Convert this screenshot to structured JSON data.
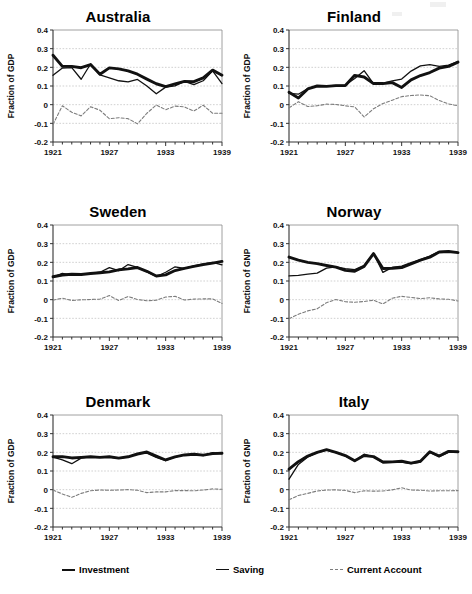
{
  "figure": {
    "panel_order": [
      "australia",
      "finland",
      "sweden",
      "norway",
      "denmark",
      "italy"
    ],
    "x_tick_labels": [
      "1921",
      "1927",
      "1933",
      "1939"
    ],
    "y_tick_labels": [
      "0.4",
      "0.3",
      "0.2",
      "0.1",
      "0",
      "-0.1",
      "-0.2"
    ],
    "colors": {
      "investment": "#111111",
      "saving": "#111111",
      "current_account": "#7d7d7d",
      "frame": "#888888",
      "gridline": "#bdbdbd",
      "background": "#ffffff"
    }
  },
  "legend": {
    "items": [
      {
        "key": "investment",
        "label": "Investment",
        "style": "thick"
      },
      {
        "key": "saving",
        "label": "Saving",
        "style": "thin"
      },
      {
        "key": "current_account",
        "label": "Current Account",
        "style": "dash"
      }
    ]
  },
  "chart_data": [
    {
      "type": "line",
      "title": "Australia",
      "xlabel": "",
      "ylabel": "Fraction of GDP",
      "xlim": [
        1921,
        1939
      ],
      "ylim": [
        -0.2,
        0.4
      ],
      "yticks": [
        0.4,
        0.3,
        0.2,
        0.1,
        0,
        -0.1,
        -0.2
      ],
      "xticks": [
        1921,
        1927,
        1933,
        1939
      ],
      "grid": true,
      "legend_position": "below-figure",
      "x": [
        1921,
        1922,
        1923,
        1924,
        1925,
        1926,
        1927,
        1928,
        1929,
        1930,
        1931,
        1932,
        1933,
        1934,
        1935,
        1936,
        1937,
        1938,
        1939
      ],
      "series": [
        {
          "name": "Investment",
          "values": [
            0.265,
            0.205,
            0.205,
            0.198,
            0.215,
            0.163,
            0.197,
            0.192,
            0.181,
            0.163,
            0.137,
            0.112,
            0.097,
            0.111,
            0.125,
            0.123,
            0.143,
            0.185,
            0.158
          ]
        },
        {
          "name": "Saving",
          "values": [
            0.157,
            0.196,
            0.198,
            0.136,
            0.218,
            0.159,
            0.143,
            0.128,
            0.122,
            0.135,
            0.1,
            0.058,
            0.094,
            0.101,
            0.125,
            0.107,
            0.128,
            0.181,
            0.113
          ]
        },
        {
          "name": "Current Account",
          "values": [
            -0.106,
            -0.006,
            -0.041,
            -0.06,
            -0.011,
            -0.03,
            -0.075,
            -0.07,
            -0.075,
            -0.103,
            -0.046,
            -0.002,
            -0.027,
            -0.008,
            -0.012,
            -0.034,
            -0.003,
            -0.046,
            -0.046
          ]
        }
      ]
    },
    {
      "type": "line",
      "title": "Finland",
      "xlabel": "",
      "ylabel": "Fraction of GDP",
      "xlim": [
        1921,
        1939
      ],
      "ylim": [
        -0.2,
        0.4
      ],
      "yticks": [
        0.4,
        0.3,
        0.2,
        0.1,
        0,
        -0.1,
        -0.2
      ],
      "xticks": [
        1921,
        1927,
        1933,
        1939
      ],
      "grid": true,
      "legend_position": "below-figure",
      "x": [
        1921,
        1922,
        1923,
        1924,
        1925,
        1926,
        1927,
        1928,
        1929,
        1930,
        1931,
        1932,
        1933,
        1934,
        1935,
        1936,
        1937,
        1938,
        1939
      ],
      "series": [
        {
          "name": "Investment",
          "values": [
            0.066,
            0.036,
            0.084,
            0.1,
            0.098,
            0.102,
            0.103,
            0.157,
            0.148,
            0.113,
            0.113,
            0.118,
            0.092,
            0.133,
            0.156,
            0.172,
            0.196,
            0.205,
            0.228
          ]
        },
        {
          "name": "Saving",
          "values": [
            0.06,
            0.056,
            0.086,
            0.099,
            0.1,
            0.103,
            0.105,
            0.14,
            0.182,
            0.113,
            0.116,
            0.128,
            0.137,
            0.18,
            0.208,
            0.215,
            0.205,
            0.212,
            0.23
          ]
        },
        {
          "name": "Current Account",
          "values": [
            -0.017,
            0.016,
            -0.01,
            -0.006,
            0.003,
            0.001,
            -0.006,
            -0.012,
            -0.066,
            -0.022,
            0.006,
            0.024,
            0.043,
            0.049,
            0.052,
            0.048,
            0.022,
            0.004,
            -0.006
          ]
        }
      ]
    },
    {
      "type": "line",
      "title": "Sweden",
      "xlabel": "",
      "ylabel": "Fraction of GDP",
      "xlim": [
        1921,
        1939
      ],
      "ylim": [
        -0.2,
        0.4
      ],
      "yticks": [
        0.4,
        0.3,
        0.2,
        0.1,
        0,
        -0.1,
        -0.2
      ],
      "xticks": [
        1921,
        1927,
        1933,
        1939
      ],
      "grid": true,
      "legend_position": "below-figure",
      "x": [
        1921,
        1922,
        1923,
        1924,
        1925,
        1926,
        1927,
        1928,
        1929,
        1930,
        1931,
        1932,
        1933,
        1934,
        1935,
        1936,
        1937,
        1938,
        1939
      ],
      "series": [
        {
          "name": "Investment",
          "values": [
            0.123,
            0.132,
            0.136,
            0.135,
            0.14,
            0.144,
            0.149,
            0.16,
            0.165,
            0.172,
            0.152,
            0.127,
            0.133,
            0.156,
            0.168,
            0.178,
            0.188,
            0.196,
            0.205
          ]
        },
        {
          "name": "Saving",
          "values": [
            0.121,
            0.141,
            0.132,
            0.134,
            0.141,
            0.147,
            0.172,
            0.155,
            0.188,
            0.173,
            0.148,
            0.124,
            0.147,
            0.176,
            0.167,
            0.181,
            0.192,
            0.2,
            0.186
          ]
        },
        {
          "name": "Current Account",
          "values": [
            -0.003,
            0.008,
            -0.004,
            -0.001,
            0.001,
            0.003,
            0.022,
            -0.005,
            0.017,
            0.001,
            -0.006,
            -0.003,
            0.014,
            0.018,
            -0.002,
            0.003,
            0.004,
            0.004,
            -0.02
          ]
        }
      ]
    },
    {
      "type": "line",
      "title": "Norway",
      "xlabel": "",
      "ylabel": "Fraction of GNP",
      "xlim": [
        1921,
        1939
      ],
      "ylim": [
        -0.2,
        0.4
      ],
      "yticks": [
        0.4,
        0.3,
        0.2,
        0.1,
        0,
        -0.1,
        -0.2
      ],
      "xticks": [
        1921,
        1927,
        1933,
        1939
      ],
      "grid": true,
      "legend_position": "below-figure",
      "x": [
        1921,
        1922,
        1923,
        1924,
        1925,
        1926,
        1927,
        1928,
        1929,
        1930,
        1931,
        1932,
        1933,
        1934,
        1935,
        1936,
        1937,
        1938,
        1939
      ],
      "series": [
        {
          "name": "Investment",
          "values": [
            0.228,
            0.212,
            0.2,
            0.193,
            0.183,
            0.174,
            0.157,
            0.152,
            0.178,
            0.247,
            0.167,
            0.168,
            0.172,
            0.191,
            0.212,
            0.228,
            0.255,
            0.258,
            0.252
          ]
        },
        {
          "name": "Saving",
          "values": [
            0.127,
            0.13,
            0.137,
            0.142,
            0.169,
            0.176,
            0.166,
            0.161,
            0.184,
            0.248,
            0.146,
            0.173,
            0.18,
            0.198,
            0.215,
            0.233,
            0.257,
            0.258,
            0.252
          ]
        },
        {
          "name": "Current Account",
          "values": [
            -0.102,
            -0.078,
            -0.06,
            -0.049,
            -0.016,
            0.001,
            -0.011,
            -0.014,
            -0.01,
            -0.003,
            -0.023,
            0.008,
            0.018,
            0.012,
            0.006,
            0.01,
            0.004,
            0.002,
            -0.007
          ]
        }
      ]
    },
    {
      "type": "line",
      "title": "Denmark",
      "xlabel": "",
      "ylabel": "Fraction of GDP",
      "xlim": [
        1921,
        1939
      ],
      "ylim": [
        -0.2,
        0.4
      ],
      "yticks": [
        0.4,
        0.3,
        0.2,
        0.1,
        0,
        -0.1,
        -0.2
      ],
      "xticks": [
        1921,
        1927,
        1933,
        1939
      ],
      "grid": true,
      "legend_position": "below-figure",
      "x": [
        1921,
        1922,
        1923,
        1924,
        1925,
        1926,
        1927,
        1928,
        1929,
        1930,
        1931,
        1932,
        1933,
        1934,
        1935,
        1936,
        1937,
        1938,
        1939
      ],
      "series": [
        {
          "name": "Investment",
          "values": [
            0.176,
            0.177,
            0.17,
            0.173,
            0.176,
            0.173,
            0.176,
            0.169,
            0.176,
            0.191,
            0.202,
            0.18,
            0.159,
            0.176,
            0.186,
            0.19,
            0.185,
            0.193,
            0.195
          ]
        },
        {
          "name": "Saving",
          "values": [
            0.174,
            0.16,
            0.139,
            0.169,
            0.176,
            0.174,
            0.175,
            0.168,
            0.176,
            0.193,
            0.196,
            0.173,
            0.156,
            0.175,
            0.188,
            0.188,
            0.182,
            0.198,
            0.193
          ]
        },
        {
          "name": "Current Account",
          "values": [
            -0.002,
            -0.023,
            -0.041,
            -0.02,
            -0.006,
            -0.002,
            -0.003,
            -0.002,
            0.0,
            -0.003,
            -0.016,
            -0.012,
            -0.012,
            -0.005,
            -0.005,
            -0.006,
            -0.002,
            0.004,
            0.002
          ]
        }
      ]
    },
    {
      "type": "line",
      "title": "Italy",
      "xlabel": "",
      "ylabel": "Fraction of GNP",
      "xlim": [
        1921,
        1939
      ],
      "ylim": [
        -0.2,
        0.4
      ],
      "yticks": [
        0.4,
        0.3,
        0.2,
        0.1,
        0,
        -0.1,
        -0.2
      ],
      "xticks": [
        1921,
        1927,
        1933,
        1939
      ],
      "grid": true,
      "legend_position": "below-figure",
      "x": [
        1921,
        1922,
        1923,
        1924,
        1925,
        1926,
        1927,
        1928,
        1929,
        1930,
        1931,
        1932,
        1933,
        1934,
        1935,
        1936,
        1937,
        1938,
        1939
      ],
      "series": [
        {
          "name": "Investment",
          "values": [
            0.11,
            0.15,
            0.18,
            0.2,
            0.214,
            0.2,
            0.183,
            0.155,
            0.183,
            0.177,
            0.148,
            0.149,
            0.152,
            0.142,
            0.152,
            0.203,
            0.18,
            0.205,
            0.203
          ]
        },
        {
          "name": "Saving",
          "values": [
            0.056,
            0.135,
            0.175,
            0.198,
            0.212,
            0.199,
            0.181,
            0.153,
            0.19,
            0.175,
            0.144,
            0.146,
            0.148,
            0.139,
            0.148,
            0.2,
            0.177,
            0.201,
            0.2
          ]
        },
        {
          "name": "Current Account",
          "values": [
            -0.054,
            -0.031,
            -0.02,
            -0.007,
            -0.002,
            -0.001,
            -0.004,
            -0.016,
            -0.006,
            -0.008,
            -0.007,
            -0.001,
            0.01,
            -0.002,
            -0.003,
            -0.007,
            -0.006,
            -0.006,
            -0.005
          ]
        }
      ]
    }
  ]
}
